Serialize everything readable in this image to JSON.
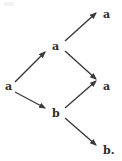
{
  "diagram": {
    "type": "tree",
    "width": 122,
    "height": 161,
    "background_color": "#ffffff",
    "stroke_color": "#3a3a3a",
    "text_color": "#2b2b2b",
    "nodes": [
      {
        "id": "root",
        "label": "a",
        "x": 8,
        "y": 86
      },
      {
        "id": "upper",
        "label": "a",
        "x": 55,
        "y": 46
      },
      {
        "id": "lower",
        "label": "b",
        "x": 55,
        "y": 113
      },
      {
        "id": "leaf-top",
        "label": "a",
        "x": 106,
        "y": 14
      },
      {
        "id": "leaf-middle",
        "label": "a",
        "x": 106,
        "y": 86
      },
      {
        "id": "leaf-bottom",
        "label": "b.",
        "x": 106,
        "y": 150
      }
    ],
    "edges": [
      {
        "id": "root-to-upper",
        "from": "root",
        "to": "upper",
        "x1": 15,
        "y1": 82,
        "x2": 45,
        "y2": 52
      },
      {
        "id": "root-to-lower",
        "from": "root",
        "to": "lower",
        "x1": 15,
        "y1": 92,
        "x2": 45,
        "y2": 108
      },
      {
        "id": "upper-to-leaf-top",
        "from": "upper",
        "to": "leaf-top",
        "x1": 65,
        "y1": 41,
        "x2": 96,
        "y2": 13
      },
      {
        "id": "upper-to-leaf-middle",
        "from": "upper",
        "to": "leaf-middle",
        "x1": 65,
        "y1": 51,
        "x2": 96,
        "y2": 79
      },
      {
        "id": "lower-to-leaf-middle",
        "from": "lower",
        "to": "leaf-middle",
        "x1": 65,
        "y1": 108,
        "x2": 96,
        "y2": 81
      },
      {
        "id": "lower-to-leaf-bottom",
        "from": "lower",
        "to": "leaf-bottom",
        "x1": 65,
        "y1": 118,
        "x2": 96,
        "y2": 145
      }
    ]
  }
}
